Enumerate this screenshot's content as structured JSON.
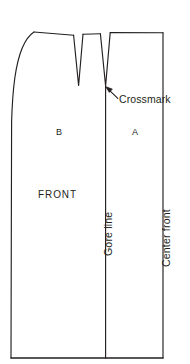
{
  "figure": {
    "kind": "sewing-pattern-draft",
    "stroke_color": "#231f20",
    "background_color": "#ffffff",
    "text_color": "#231f20"
  },
  "labels": {
    "section_b": "B",
    "section_a": "A",
    "front": "FRONT",
    "crossmark": "Crossmark",
    "gore_line": "Gore line",
    "center_front": "Center front"
  },
  "geometry": {
    "left_edge_x": 11,
    "right_edge_x": 163,
    "hem_y": 358,
    "waist_y": 33,
    "gore_line_x": 105,
    "dart1_tip_y": 85,
    "dart2_tip_y": 85
  }
}
